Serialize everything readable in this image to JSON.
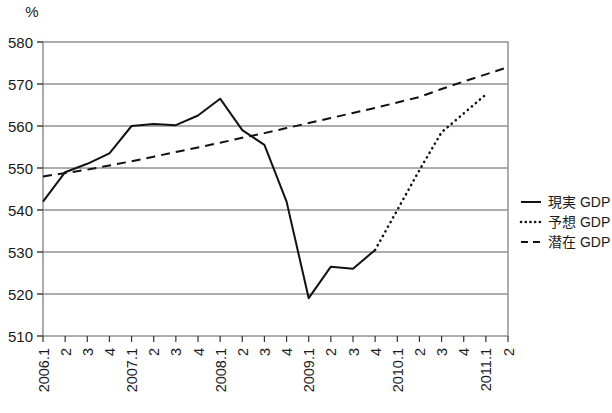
{
  "chart_data": {
    "type": "line",
    "title": "",
    "subtitle": "",
    "xlabel": "",
    "ylabel": "",
    "unit_label": "%",
    "ylim": [
      510,
      580
    ],
    "yticks": [
      510,
      520,
      530,
      540,
      550,
      560,
      570,
      580
    ],
    "ytick_labels": [
      "510",
      "520",
      "530",
      "540",
      "550",
      "560",
      "570",
      "580"
    ],
    "grid": true,
    "grid_axis": "y",
    "legend_position": "right",
    "categories": [
      "2006.1",
      "2",
      "3",
      "4",
      "2007.1",
      "2",
      "3",
      "4",
      "2008.1",
      "2",
      "3",
      "4",
      "2009.1",
      "2",
      "3",
      "4",
      "2010.1",
      "2",
      "3",
      "4",
      "2011.1",
      "2"
    ],
    "x": [
      "2006.1",
      "2006.2",
      "2006.3",
      "2006.4",
      "2007.1",
      "2007.2",
      "2007.3",
      "2007.4",
      "2008.1",
      "2008.2",
      "2008.3",
      "2008.4",
      "2009.1",
      "2009.2",
      "2009.3",
      "2009.4",
      "2010.1",
      "2010.2",
      "2010.3",
      "2010.4",
      "2011.1",
      "2011.2"
    ],
    "series": [
      {
        "name": "現実 GDP",
        "style": "solid",
        "color": "#111111",
        "values": [
          542.0,
          549.0,
          551.0,
          553.5,
          560.0,
          560.5,
          560.2,
          562.5,
          566.5,
          559.0,
          555.5,
          542.0,
          519.0,
          526.5,
          526.0,
          530.5,
          null,
          null,
          null,
          null,
          null,
          null
        ]
      },
      {
        "name": "予想 GDP",
        "style": "dotted",
        "color": "#111111",
        "values": [
          null,
          null,
          null,
          null,
          null,
          null,
          null,
          null,
          null,
          null,
          null,
          null,
          null,
          null,
          null,
          530.5,
          540.0,
          549.5,
          558.5,
          563.0,
          567.5,
          null
        ]
      },
      {
        "name": "潜在 GDP",
        "style": "dashed",
        "color": "#111111",
        "values": [
          548.0,
          548.8,
          549.6,
          550.6,
          551.6,
          552.7,
          553.8,
          554.9,
          556.0,
          557.2,
          558.3,
          559.5,
          560.7,
          561.9,
          563.1,
          564.3,
          565.6,
          566.9,
          568.8,
          570.6,
          572.3,
          574.0
        ]
      }
    ],
    "legend": [
      {
        "label": "現実 GDP",
        "style": "solid"
      },
      {
        "label": "予想 GDP",
        "style": "dotted"
      },
      {
        "label": "潜在 GDP",
        "style": "dashed"
      }
    ]
  },
  "colors": {
    "line": "#111111",
    "grid": "#5a5a5a",
    "axis": "#333333",
    "border": "#8a8a8a",
    "background": "#ffffff"
  }
}
